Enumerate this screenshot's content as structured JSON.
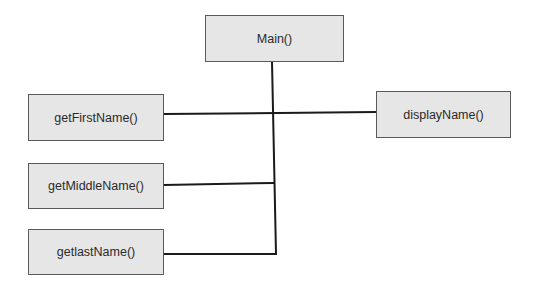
{
  "diagram": {
    "nodes": [
      {
        "id": "main",
        "label": "Main()",
        "x": 205,
        "y": 15,
        "w": 139,
        "h": 47
      },
      {
        "id": "getFirstName",
        "label": "getFirstName()",
        "x": 28,
        "y": 94,
        "w": 136,
        "h": 47
      },
      {
        "id": "getMiddleName",
        "label": "getMiddleName()",
        "x": 28,
        "y": 163,
        "w": 136,
        "h": 46
      },
      {
        "id": "getlastName",
        "label": "getlastName()",
        "x": 28,
        "y": 229,
        "w": 136,
        "h": 46
      },
      {
        "id": "displayName",
        "label": "displayName()",
        "x": 376,
        "y": 91,
        "w": 135,
        "h": 47
      }
    ],
    "edges": [
      {
        "from": "main",
        "to": "trunk"
      },
      {
        "from": "trunk",
        "to": "getFirstName"
      },
      {
        "from": "trunk",
        "to": "displayName"
      },
      {
        "from": "trunk",
        "to": "getMiddleName"
      },
      {
        "from": "trunk",
        "to": "getlastName"
      }
    ],
    "line_color": "#1a1a1a",
    "box_fill": "#e6e6e6",
    "box_border": "#5a5a5a"
  }
}
